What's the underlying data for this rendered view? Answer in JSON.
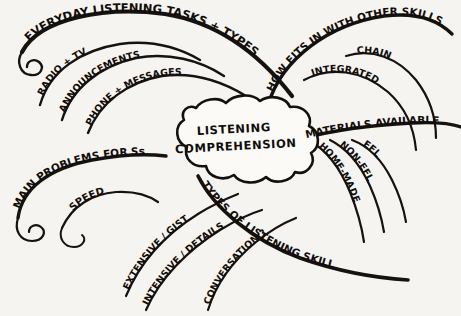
{
  "diagram": {
    "type": "mind-map",
    "style": "hand-drawn ink sketch",
    "background_color": "#f6f4f0",
    "ink_color": "#15120f",
    "central_node": {
      "shape": "cloud",
      "line_1": "LISTENING",
      "line_2": "COMPREHENSION"
    },
    "branches": [
      {
        "id": "everyday-listening",
        "label": "EVERYDAY LISTENING TASKS + TYPES",
        "direction": "upper-left",
        "children": [
          {
            "id": "radio-tv",
            "label": "RADIO + TV"
          },
          {
            "id": "announcements",
            "label": "ANNOUNCEMENTS"
          },
          {
            "id": "phone-messages",
            "label": "PHONE + MESSAGES"
          }
        ]
      },
      {
        "id": "how-fits-in",
        "label": "HOW FITS IN WITH OTHER SKILLS",
        "direction": "upper-right",
        "children": [
          {
            "id": "integrated",
            "label": "INTEGRATED"
          },
          {
            "id": "chain",
            "label": "CHAIN"
          }
        ]
      },
      {
        "id": "materials-available",
        "label": "MATERIALS AVAILABLE",
        "direction": "right",
        "children": [
          {
            "id": "efl",
            "label": "EFL"
          },
          {
            "id": "non-efl",
            "label": "NON-EFL"
          },
          {
            "id": "home-made",
            "label": "HOME-MADE"
          }
        ]
      },
      {
        "id": "main-problems",
        "label": "MAIN PROBLEMS FOR Ss",
        "direction": "left",
        "children": [
          {
            "id": "speed",
            "label": "SPEED"
          }
        ]
      },
      {
        "id": "types-of-listening-skill",
        "label": "TYPES OF LISTENING SKILL",
        "direction": "lower-right",
        "children": [
          {
            "id": "extensive-gist",
            "label": "EXTENSIVE / GIST"
          },
          {
            "id": "intensive-details",
            "label": "INTENSIVE / DETAILS"
          },
          {
            "id": "conversation",
            "label": "CONVERSATION ?"
          }
        ]
      }
    ]
  }
}
